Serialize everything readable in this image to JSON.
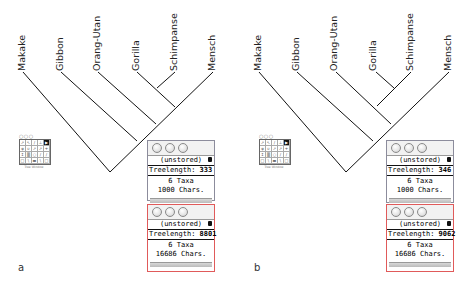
{
  "panels": [
    {
      "letter": "a",
      "taxa": [
        "Makake",
        "Gibbon",
        "Orang-Utan",
        "Gorilla",
        "Schimpanse",
        "Mensch"
      ],
      "topology": "(Makake,(Gibbon,(Orang-Utan,(Gorilla,(Schimpanse,Mensch)))))",
      "windows": [
        {
          "status": "(unstored)",
          "treelength_label": "Treelength:",
          "treelength_value": "333",
          "taxa_line": "6 Taxa",
          "chars_line": "1000 Chars.",
          "border": "#8c8c9c"
        },
        {
          "status": "(unstored)",
          "treelength_label": "Treelength:",
          "treelength_value": "8801",
          "taxa_line": "6 Taxa",
          "chars_line": "16686 Chars.",
          "border": "#e05a5a"
        }
      ],
      "palette_caption": "Tree Window"
    },
    {
      "letter": "b",
      "taxa": [
        "Makake",
        "Gibbon",
        "Orang-Utan",
        "Gorilla",
        "Schimpanse",
        "Mensch"
      ],
      "topology": "(Makake,(Gibbon,(Mensch,(Orang-Utan,(Gorilla,Schimpanse)))))",
      "windows": [
        {
          "status": "(unstored)",
          "treelength_label": "Treelength:",
          "treelength_value": "346",
          "taxa_line": "6 Taxa",
          "chars_line": "1000 Chars.",
          "border": "#8c8c9c"
        },
        {
          "status": "(unstored)",
          "treelength_label": "Treelength:",
          "treelength_value": "9062",
          "taxa_line": "6 Taxa",
          "chars_line": "16686 Chars.",
          "border": "#e05a5a"
        }
      ],
      "palette_caption": "Tree Window"
    }
  ],
  "palette_icons": [
    "arrow",
    "hand",
    "line",
    "branch",
    "cursor",
    "reroot",
    "swap",
    "move",
    "prune",
    "graft",
    "label",
    "select",
    "zoom",
    "search",
    "ruler"
  ]
}
